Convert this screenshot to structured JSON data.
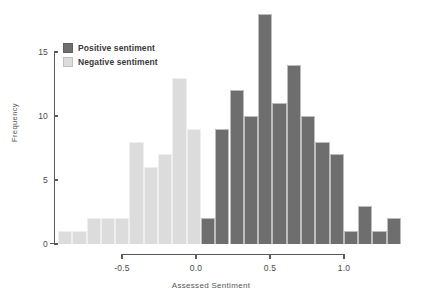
{
  "chart_data": {
    "type": "bar",
    "title": "",
    "subtitle": "",
    "xlabel": "Assessed Sentiment",
    "ylabel": "Frequency",
    "xlim": [
      -0.78,
      1.37
    ],
    "ylim": [
      0,
      15.9
    ],
    "grid": false,
    "bin_width": 0.125,
    "legend_position": "top-left",
    "xticks": [
      -0.5,
      0.0,
      0.5,
      1.0
    ],
    "xtick_labels": [
      "-0.5",
      "0.0",
      "0.5",
      "1.0"
    ],
    "yticks": [
      0,
      5,
      10,
      15
    ],
    "ytick_labels": [
      "0",
      "5",
      "10",
      "15"
    ],
    "legend": [
      {
        "name": "Positive sentiment",
        "color": "#6e6e6e"
      },
      {
        "name": "Negative sentiment",
        "color": "#dcdcdc"
      }
    ],
    "series": [
      {
        "name": "Negative sentiment",
        "color": "#dcdcdc",
        "bins": [
          {
            "x0": -0.78,
            "x1": -0.655,
            "value": 1
          },
          {
            "x0": -0.655,
            "x1": -0.53,
            "value": 1
          },
          {
            "x0": -0.53,
            "x1": -0.405,
            "value": 2
          },
          {
            "x0": -0.405,
            "x1": -0.28,
            "value": 2
          },
          {
            "x0": -0.28,
            "x1": -0.155,
            "value": 2
          },
          {
            "x0": -0.155,
            "x1": -0.03,
            "value": 8
          },
          {
            "x0": -0.03,
            "x1": 0.095,
            "value": 6
          },
          {
            "x0": 0.095,
            "x1": 0.22,
            "value": 7
          },
          {
            "x0": 0.22,
            "x1": 0.345,
            "value": 13
          },
          {
            "x0": 0.345,
            "x1": 0.47,
            "value": 9
          }
        ]
      },
      {
        "name": "Positive sentiment",
        "color": "#6e6e6e",
        "bins": [
          {
            "x0": 0.47,
            "x1": 0.595,
            "value": 2
          },
          {
            "x0": 0.595,
            "x1": 0.72,
            "value": 9
          },
          {
            "x0": 0.72,
            "x1": 0.845,
            "value": 12
          },
          {
            "x0": 0.845,
            "x1": 0.97,
            "value": 10
          },
          {
            "x0": 0.97,
            "x1": 1.095,
            "value": 18
          },
          {
            "x0": 1.095,
            "x1": 1.22,
            "value": 11
          },
          {
            "x0": 1.22,
            "x1": 1.345,
            "value": 14
          },
          {
            "x0": 1.345,
            "x1": 1.47,
            "value": 10
          },
          {
            "x0": 1.47,
            "x1": 1.595,
            "value": 8
          },
          {
            "x0": 1.595,
            "x1": 1.72,
            "value": 7
          },
          {
            "x0": 1.72,
            "x1": 1.845,
            "value": 1
          },
          {
            "x0": 1.845,
            "x1": 1.97,
            "value": 3
          },
          {
            "x0": 1.97,
            "x1": 2.095,
            "value": 1
          },
          {
            "x0": 2.095,
            "x1": 2.22,
            "value": 2
          }
        ]
      }
    ]
  },
  "axes": {
    "y_title": "Frequency",
    "x_title": "Assessed Sentiment"
  }
}
